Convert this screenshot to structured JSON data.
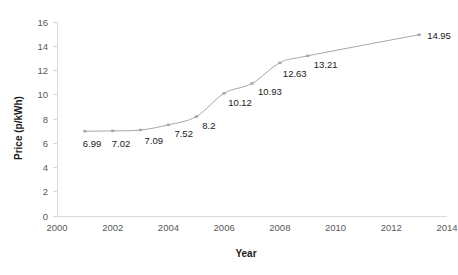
{
  "chart_data": {
    "type": "line",
    "title": "",
    "xlabel": "Year",
    "ylabel": "Price (p/kWh)",
    "x": [
      2001,
      2002,
      2003,
      2004,
      2005,
      2006,
      2007,
      2008,
      2009,
      2013
    ],
    "values": [
      6.99,
      7.02,
      7.09,
      7.52,
      8.2,
      10.12,
      10.93,
      12.63,
      13.21,
      14.95
    ],
    "point_labels": [
      "6.99",
      "7.02",
      "7.09",
      "7.52",
      "8.2",
      "10.12",
      "10.93",
      "12.63",
      "13.21",
      "14.95"
    ],
    "xlim": [
      2000,
      2014
    ],
    "ylim": [
      0,
      16
    ],
    "xticks": [
      2000,
      2002,
      2004,
      2006,
      2008,
      2010,
      2012,
      2014
    ],
    "xtick_labels": [
      "2000",
      "2002",
      "2004",
      "2006",
      "2008",
      "2010",
      "2012",
      "2014"
    ],
    "yticks": [
      0,
      2,
      4,
      6,
      8,
      10,
      12,
      14,
      16
    ],
    "ytick_labels": [
      "0",
      "2",
      "4",
      "6",
      "8",
      "10",
      "12",
      "14",
      "16"
    ],
    "grid": false,
    "legend": "none",
    "series_color": "#a6a6a6",
    "marker_color": "#a6a6a6",
    "axis_color": "#d9d9d9",
    "label_color": "#595959"
  },
  "axes": {
    "y_title": "Price (p/kWh)",
    "x_title": "Year"
  }
}
